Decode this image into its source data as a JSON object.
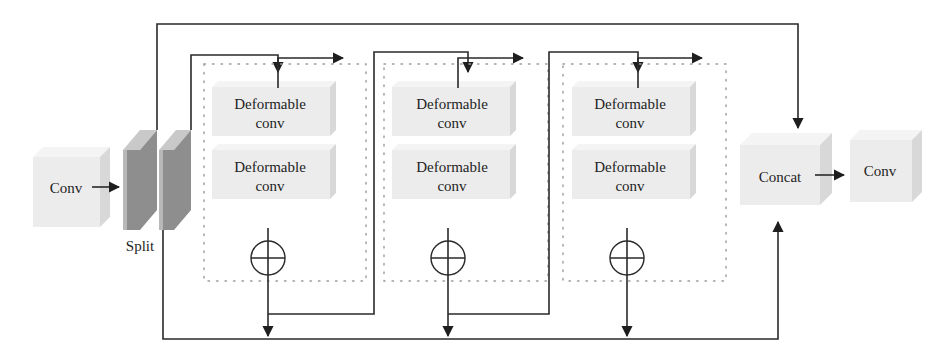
{
  "diagram": {
    "title": "",
    "input_block": {
      "label": "Conv"
    },
    "split": {
      "label": "Split"
    },
    "residual_blocks": [
      {
        "conv1_line1": "Deformable",
        "conv1_line2": "conv",
        "conv2_line1": "Deformable",
        "conv2_line2": "conv",
        "merge": "add"
      },
      {
        "conv1_line1": "Deformable",
        "conv1_line2": "conv",
        "conv2_line1": "Deformable",
        "conv2_line2": "conv",
        "merge": "add"
      },
      {
        "conv1_line1": "Deformable",
        "conv1_line2": "conv",
        "conv2_line1": "Deformable",
        "conv2_line2": "conv",
        "merge": "add"
      }
    ],
    "concat_block": {
      "label": "Concat"
    },
    "output_block": {
      "label": "Conv"
    },
    "icons": {
      "add": "circle-plus-icon",
      "arrow": "arrowhead-icon"
    },
    "colors": {
      "block_face": "#ececec",
      "plate": "#8e8e8e",
      "wire": "#2a2a2a",
      "dotted_border": "#9a9a9a"
    }
  }
}
